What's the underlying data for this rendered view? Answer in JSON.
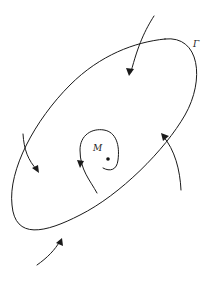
{
  "diagram": {
    "curve_label": "Γ",
    "point_label": "M",
    "colors": {
      "line": "#1a1a1a",
      "background": "#ffffff"
    },
    "elements": [
      {
        "type": "closed-curve",
        "name": "Gamma",
        "shape": "tilted ellipse"
      },
      {
        "type": "point",
        "name": "M"
      },
      {
        "type": "spiral-trajectory",
        "around": "M",
        "arrow_direction": "down"
      },
      {
        "type": "trajectory",
        "position": "top",
        "arrow_direction": "inward"
      },
      {
        "type": "trajectory",
        "position": "left",
        "arrow_direction": "inward"
      },
      {
        "type": "trajectory",
        "position": "right",
        "arrow_direction": "inward"
      },
      {
        "type": "trajectory",
        "position": "bottom",
        "arrow_direction": "inward"
      }
    ]
  }
}
